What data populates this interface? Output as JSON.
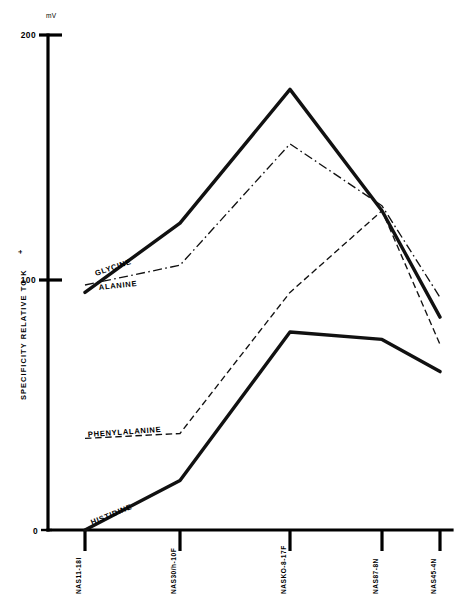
{
  "chart_data": {
    "type": "line",
    "title": "",
    "xlabel": "",
    "ylabel": "SPECIFICITY  RELATIVE  TO  K",
    "ylabel_sup": "+",
    "yunit": "mV",
    "ylim": [
      0,
      200
    ],
    "yticks": [
      0,
      100,
      200
    ],
    "ytick_labels": [
      "0",
      "100",
      "200"
    ],
    "grid": false,
    "legend": "inline-labels",
    "categories": [
      "NAS11-18I",
      "NAS30/h-10F",
      "NASKO-8-17F",
      "NAS87-8N",
      "NAS45-4N"
    ],
    "series": [
      {
        "name": "GLYCINE",
        "style": "solid",
        "values": [
          96,
          124,
          178,
          129,
          86
        ],
        "label_text": "GLYCINE"
      },
      {
        "name": "ALANINE",
        "style": "dash-dot",
        "values": [
          99,
          107,
          156,
          131,
          94
        ],
        "label_text": "ALANINE"
      },
      {
        "name": "PHENYLALANINE",
        "style": "dashed",
        "values": [
          37,
          39,
          96,
          129,
          75
        ],
        "label_text": "PHENYLALANINE"
      },
      {
        "name": "HISTIDINE",
        "style": "solid",
        "values": [
          0,
          20,
          80,
          77,
          64
        ],
        "label_text": "HISTIDINE"
      }
    ]
  }
}
